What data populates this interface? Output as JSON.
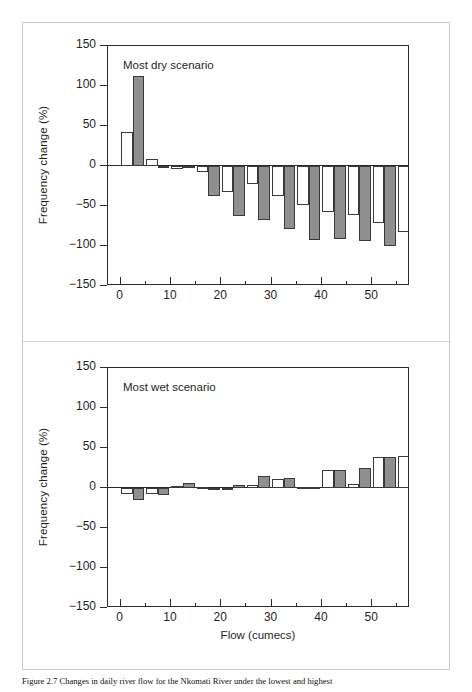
{
  "figure": {
    "caption": "Figure 2.7   Changes in daily river flow for the Nkomati River under the lowest and highest",
    "background": "#ffffff",
    "frame_color": "#c9c9c9"
  },
  "axis": {
    "y_label": "Frequency change (%)",
    "x_label": "Flow (cumecs)",
    "y_ticks": [
      150,
      100,
      50,
      0,
      -50,
      -100,
      -150
    ],
    "y_tick_labels": [
      "150",
      "100",
      "50",
      "0",
      "−50",
      "−100",
      "−150"
    ],
    "x_major_ticks": [
      0,
      10,
      20,
      30,
      40,
      50
    ],
    "x_major_tick_labels": [
      "0",
      "10",
      "20",
      "30",
      "40",
      "50"
    ],
    "x_minor_ticks": [
      5,
      15,
      25,
      35,
      45,
      55
    ],
    "ylim": [
      -150,
      150
    ],
    "xlim": [
      -2.5,
      57.5
    ]
  },
  "colors": {
    "bar_white": "#ffffff",
    "bar_gray": "#8f8f8f",
    "bar_outline": "#3a3a3a",
    "axis": "#2b2b2b",
    "text": "#1f1f1f"
  },
  "panels": [
    {
      "id": "dry",
      "title": "Most dry scenario"
    },
    {
      "id": "wet",
      "title": "Most wet scenario"
    }
  ],
  "chart_data": [
    {
      "type": "bar",
      "title": "Most dry scenario",
      "xlabel": "Flow (cumecs)",
      "ylabel": "Frequency change (%)",
      "xlim": [
        -2.5,
        57.5
      ],
      "ylim": [
        -150,
        150
      ],
      "grid": false,
      "legend": "none",
      "categories": [
        0,
        5,
        10,
        15,
        20,
        25,
        30,
        35,
        40,
        45,
        50,
        55
      ],
      "x_bin_centers": [
        2.5,
        7.5,
        12.5,
        17.5,
        22.5,
        27.5,
        32.5,
        37.5,
        42.5,
        47.5,
        52.5,
        57.5
      ],
      "series": [
        {
          "name": "white",
          "values": [
            42,
            9,
            -4,
            -7,
            -32,
            -22,
            -38,
            -49,
            -57,
            -61,
            -71,
            -83
          ]
        },
        {
          "name": "gray",
          "values": [
            112,
            0,
            -3,
            -37,
            -62,
            -67,
            -79,
            -92,
            -91,
            -94,
            -100,
            -101
          ]
        }
      ]
    },
    {
      "type": "bar",
      "title": "Most wet scenario",
      "xlabel": "Flow (cumecs)",
      "ylabel": "Frequency change (%)",
      "xlim": [
        -2.5,
        57.5
      ],
      "ylim": [
        -150,
        150
      ],
      "grid": false,
      "legend": "none",
      "categories": [
        0,
        5,
        10,
        15,
        20,
        25,
        30,
        35,
        40,
        45,
        50,
        55
      ],
      "x_bin_centers": [
        2.5,
        7.5,
        12.5,
        17.5,
        22.5,
        27.5,
        32.5,
        37.5,
        42.5,
        47.5,
        52.5,
        57.5
      ],
      "series": [
        {
          "name": "white",
          "values": [
            -8,
            -7,
            3,
            1,
            -2,
            4,
            11,
            1,
            22,
            5,
            39,
            40
          ]
        },
        {
          "name": "gray",
          "values": [
            -15,
            -9,
            6,
            0,
            4,
            15,
            12,
            1,
            22,
            25,
            39,
            80
          ]
        }
      ]
    }
  ]
}
